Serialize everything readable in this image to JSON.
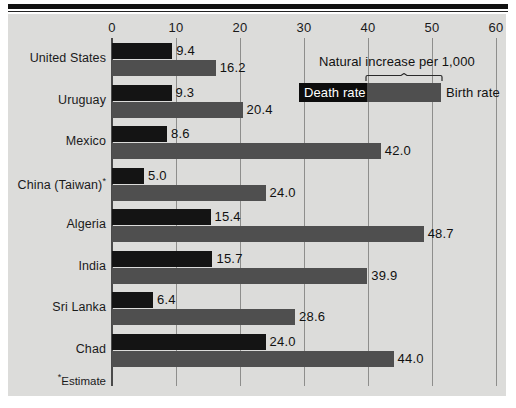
{
  "chart_data": {
    "type": "bar",
    "orientation": "horizontal",
    "title": "",
    "xlabel": "",
    "ylabel": "",
    "xlim": [
      0,
      60
    ],
    "xticks": [
      0,
      10,
      20,
      30,
      40,
      50,
      60
    ],
    "xtick_labels": [
      "0",
      "10",
      "20",
      "30",
      "40",
      "50",
      "60"
    ],
    "grid": true,
    "legend_position": "top-right",
    "categories": [
      "United States",
      "Uruguay",
      "Mexico",
      "China (Taiwan)*",
      "Algeria",
      "India",
      "Sri Lanka",
      "Chad"
    ],
    "series": [
      {
        "name": "Death rate",
        "color": "#141414",
        "values": [
          9.4,
          9.3,
          8.6,
          5.0,
          15.4,
          15.7,
          6.4,
          24.0
        ]
      },
      {
        "name": "Birth rate",
        "color": "#4f4f4f",
        "values": [
          16.2,
          20.4,
          42.0,
          24.0,
          48.7,
          39.9,
          28.6,
          44.0
        ]
      }
    ],
    "value_labels": {
      "death": [
        "9.4",
        "9.3",
        "8.6",
        "5.0",
        "15.4",
        "15.7",
        "6.4",
        "24.0"
      ],
      "birth": [
        "16.2",
        "20.4",
        "42.0",
        "24.0",
        "48.7",
        "39.9",
        "28.6",
        "44.0"
      ]
    },
    "annotations": [
      "Natural increase per 1,000",
      "*Estimate"
    ]
  },
  "legend": {
    "bracket_title": "Natural increase per 1,000",
    "death_label": "Death rate",
    "birth_label": "Birth rate"
  },
  "footnote": {
    "marker": "*",
    "text": "Estimate"
  },
  "colors": {
    "background": "#dcdcda",
    "death_bar": "#141414",
    "birth_bar": "#4f4f4f",
    "gridline": "#8e8e8c",
    "axis": "#4a4a4a",
    "text": "#111111"
  }
}
